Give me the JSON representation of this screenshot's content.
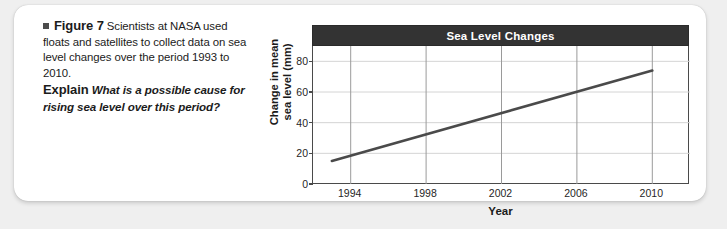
{
  "caption": {
    "bullet_icon": "square-bullet-icon",
    "figure_label": "Figure 7",
    "body_text": "Scientists at NASA used floats and satellites to collect data on sea level changes over the period 1993 to 2010.",
    "explain_label": "Explain",
    "explain_question": "What is a possible cause for rising sea level over this period?"
  },
  "chart_data": {
    "type": "line",
    "title": "Sea Level Changes",
    "xlabel": "Year",
    "ylabel": "Change in mean sea level (mm)",
    "ylabel_line1": "Change in mean",
    "ylabel_line2": "sea level (mm)",
    "xlim": [
      1992,
      2012
    ],
    "ylim": [
      0,
      90
    ],
    "xticks": [
      1994,
      1998,
      2002,
      2006,
      2010
    ],
    "xtick_labels": [
      "1994",
      "1998",
      "2002",
      "2006",
      "2010"
    ],
    "yticks": [
      0,
      20,
      40,
      60,
      80
    ],
    "ytick_labels": [
      "0",
      "20",
      "40",
      "60",
      "80"
    ],
    "grid": "both",
    "legend": "none",
    "series": [
      {
        "name": "Change in mean sea level",
        "x": [
          1993,
          2010
        ],
        "values": [
          15,
          74
        ],
        "color": "#4a4a4a"
      }
    ],
    "title_bar_color": "#333333",
    "title_text_color": "#ffffff"
  }
}
